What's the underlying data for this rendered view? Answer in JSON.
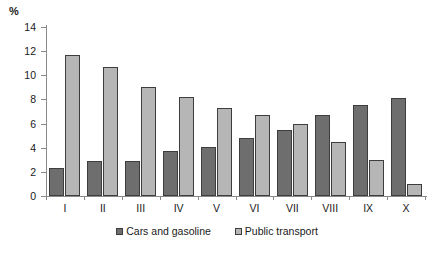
{
  "chart_data": {
    "type": "bar",
    "title": "",
    "subtitle": "",
    "xlabel": "",
    "ylabel": "%",
    "unit_label": "%",
    "categories": [
      "I",
      "II",
      "III",
      "IV",
      "V",
      "VI",
      "VII",
      "VIII",
      "IX",
      "X"
    ],
    "series": [
      {
        "name": "Cars and gasoline",
        "color": "#6e6e6e",
        "values": [
          2.3,
          2.9,
          2.9,
          3.7,
          4.1,
          4.8,
          5.5,
          6.7,
          7.5,
          8.1
        ]
      },
      {
        "name": "Public transport",
        "color": "#b6b6b6",
        "values": [
          11.7,
          10.7,
          9.0,
          8.2,
          7.3,
          6.7,
          6.0,
          4.5,
          3.0,
          1.0
        ]
      }
    ],
    "ylim": [
      0,
      14
    ],
    "ytick_step": 2,
    "yticks": [
      0,
      2,
      4,
      6,
      8,
      10,
      12,
      14
    ],
    "ytick_labels": [
      "0",
      "2",
      "4",
      "6",
      "8",
      "10",
      "12",
      "14"
    ],
    "grid": false,
    "legend_position": "bottom"
  },
  "legend": {
    "items": [
      {
        "label": "Cars and gasoline",
        "color": "#6e6e6e"
      },
      {
        "label": "Public transport",
        "color": "#b6b6b6"
      }
    ]
  }
}
